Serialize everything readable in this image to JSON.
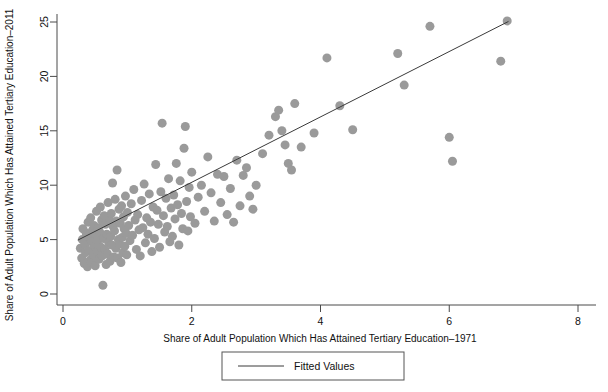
{
  "chart_data": {
    "type": "scatter",
    "title": "",
    "xlabel": "Share of Adult Population Which Has Attained Tertiary Education–1971",
    "ylabel": "Share of Adult Population Which Has Attained Tertiary Education–2011",
    "xlim": [
      0,
      8
    ],
    "ylim": [
      0,
      26
    ],
    "xticks": [
      0,
      2,
      4,
      6,
      8
    ],
    "yticks": [
      0,
      5,
      10,
      15,
      20,
      25
    ],
    "xtick_labels": [
      "0",
      "2",
      "4",
      "6",
      "8"
    ],
    "ytick_labels": [
      "0",
      "5",
      "10",
      "15",
      "20",
      "25"
    ],
    "grid": false,
    "legend": {
      "position": "bottom-center",
      "entries": [
        {
          "label": "Fitted Values",
          "marker": "line",
          "color": "#3a3a3a"
        }
      ]
    },
    "marker": {
      "shape": "circle",
      "color": "#9a9a9a",
      "size_px": 9,
      "opacity": 1
    },
    "series": [
      {
        "name": "Countries",
        "type": "scatter",
        "color": "#9a9a9a",
        "points": [
          [
            0.27,
            4.2
          ],
          [
            0.29,
            3.3
          ],
          [
            0.3,
            5.0
          ],
          [
            0.31,
            6.0
          ],
          [
            0.33,
            2.8
          ],
          [
            0.34,
            4.6
          ],
          [
            0.35,
            3.8
          ],
          [
            0.36,
            5.6
          ],
          [
            0.38,
            2.5
          ],
          [
            0.39,
            6.6
          ],
          [
            0.4,
            4.0
          ],
          [
            0.41,
            5.2
          ],
          [
            0.42,
            3.1
          ],
          [
            0.43,
            7.0
          ],
          [
            0.44,
            4.8
          ],
          [
            0.45,
            2.9
          ],
          [
            0.46,
            5.9
          ],
          [
            0.47,
            3.6
          ],
          [
            0.48,
            6.3
          ],
          [
            0.49,
            4.4
          ],
          [
            0.5,
            2.6
          ],
          [
            0.51,
            5.4
          ],
          [
            0.52,
            7.6
          ],
          [
            0.53,
            3.9
          ],
          [
            0.54,
            4.9
          ],
          [
            0.55,
            6.1
          ],
          [
            0.56,
            3.2
          ],
          [
            0.57,
            5.7
          ],
          [
            0.58,
            8.0
          ],
          [
            0.59,
            4.3
          ],
          [
            0.6,
            6.8
          ],
          [
            0.61,
            3.5
          ],
          [
            0.62,
            0.8
          ],
          [
            0.63,
            5.1
          ],
          [
            0.64,
            7.2
          ],
          [
            0.65,
            4.1
          ],
          [
            0.66,
            6.4
          ],
          [
            0.67,
            2.7
          ],
          [
            0.68,
            5.5
          ],
          [
            0.69,
            3.7
          ],
          [
            0.7,
            8.4
          ],
          [
            0.71,
            4.7
          ],
          [
            0.72,
            6.9
          ],
          [
            0.73,
            3.0
          ],
          [
            0.74,
            5.3
          ],
          [
            0.75,
            7.4
          ],
          [
            0.76,
            4.5
          ],
          [
            0.77,
            10.2
          ],
          [
            0.78,
            6.2
          ],
          [
            0.79,
            3.4
          ],
          [
            0.8,
            5.8
          ],
          [
            0.81,
            8.7
          ],
          [
            0.82,
            4.2
          ],
          [
            0.83,
            6.7
          ],
          [
            0.84,
            11.4
          ],
          [
            0.85,
            3.3
          ],
          [
            0.86,
            5.0
          ],
          [
            0.87,
            7.8
          ],
          [
            0.88,
            4.6
          ],
          [
            0.89,
            6.5
          ],
          [
            0.9,
            2.9
          ],
          [
            0.91,
            8.1
          ],
          [
            0.92,
            5.2
          ],
          [
            0.93,
            3.8
          ],
          [
            0.94,
            7.1
          ],
          [
            0.95,
            6.0
          ],
          [
            0.96,
            4.4
          ],
          [
            0.97,
            9.0
          ],
          [
            0.98,
            5.6
          ],
          [
            0.99,
            3.6
          ],
          [
            1.0,
            7.5
          ],
          [
            1.02,
            6.3
          ],
          [
            1.04,
            4.9
          ],
          [
            1.06,
            8.3
          ],
          [
            1.08,
            5.4
          ],
          [
            1.1,
            9.6
          ],
          [
            1.12,
            6.8
          ],
          [
            1.14,
            4.1
          ],
          [
            1.16,
            7.3
          ],
          [
            1.18,
            5.9
          ],
          [
            1.2,
            3.5
          ],
          [
            1.22,
            8.6
          ],
          [
            1.24,
            6.1
          ],
          [
            1.26,
            10.1
          ],
          [
            1.28,
            4.7
          ],
          [
            1.3,
            7.0
          ],
          [
            1.32,
            5.5
          ],
          [
            1.34,
            9.2
          ],
          [
            1.36,
            6.6
          ],
          [
            1.38,
            3.9
          ],
          [
            1.4,
            8.0
          ],
          [
            1.42,
            5.1
          ],
          [
            1.44,
            11.9
          ],
          [
            1.46,
            7.7
          ],
          [
            1.48,
            6.4
          ],
          [
            1.5,
            4.3
          ],
          [
            1.52,
            9.4
          ],
          [
            1.54,
            15.7
          ],
          [
            1.56,
            7.2
          ],
          [
            1.58,
            5.7
          ],
          [
            1.6,
            8.8
          ],
          [
            1.62,
            6.2
          ],
          [
            1.64,
            10.6
          ],
          [
            1.66,
            4.8
          ],
          [
            1.68,
            7.9
          ],
          [
            1.7,
            5.3
          ],
          [
            1.72,
            9.1
          ],
          [
            1.74,
            6.9
          ],
          [
            1.76,
            12.0
          ],
          [
            1.78,
            8.2
          ],
          [
            1.8,
            4.5
          ],
          [
            1.82,
            10.4
          ],
          [
            1.84,
            7.4
          ],
          [
            1.86,
            6.0
          ],
          [
            1.88,
            13.4
          ],
          [
            1.9,
            15.4
          ],
          [
            1.92,
            8.5
          ],
          [
            1.94,
            5.8
          ],
          [
            1.96,
            9.8
          ],
          [
            1.98,
            7.1
          ],
          [
            2.0,
            11.2
          ],
          [
            2.05,
            6.5
          ],
          [
            2.1,
            8.9
          ],
          [
            2.15,
            10.0
          ],
          [
            2.2,
            7.6
          ],
          [
            2.25,
            12.6
          ],
          [
            2.3,
            9.3
          ],
          [
            2.35,
            6.7
          ],
          [
            2.4,
            11.0
          ],
          [
            2.45,
            8.4
          ],
          [
            2.5,
            10.8
          ],
          [
            2.55,
            7.3
          ],
          [
            2.6,
            9.7
          ],
          [
            2.65,
            6.6
          ],
          [
            2.7,
            12.3
          ],
          [
            2.75,
            8.1
          ],
          [
            2.8,
            10.9
          ],
          [
            2.85,
            11.6
          ],
          [
            2.9,
            9.0
          ],
          [
            2.95,
            7.8
          ],
          [
            3.0,
            10.0
          ],
          [
            3.1,
            12.9
          ],
          [
            3.2,
            14.6
          ],
          [
            3.3,
            16.3
          ],
          [
            3.35,
            16.9
          ],
          [
            3.4,
            15.0
          ],
          [
            3.45,
            13.7
          ],
          [
            3.5,
            12.0
          ],
          [
            3.55,
            11.4
          ],
          [
            3.6,
            17.5
          ],
          [
            3.7,
            13.5
          ],
          [
            3.9,
            14.8
          ],
          [
            4.1,
            21.7
          ],
          [
            4.3,
            17.3
          ],
          [
            4.5,
            15.1
          ],
          [
            5.2,
            22.1
          ],
          [
            5.3,
            19.2
          ],
          [
            5.7,
            24.6
          ],
          [
            6.0,
            14.4
          ],
          [
            6.05,
            12.2
          ],
          [
            6.8,
            21.4
          ],
          [
            6.9,
            25.1
          ]
        ]
      }
    ],
    "fit_line": {
      "name": "Fitted Values",
      "color": "#3a3a3a",
      "width_px": 1,
      "x_start": 0.23,
      "y_start": 4.95,
      "x_end": 6.92,
      "y_end": 25.05
    }
  },
  "legend_box": {
    "label": "Fitted Values",
    "border_color": "#555555"
  }
}
